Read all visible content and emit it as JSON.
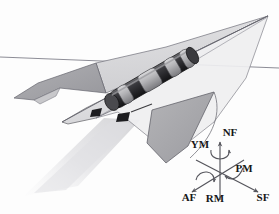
{
  "figure": {
    "background_color": "#fdfdfd",
    "horizon": {
      "name": "horizon-line",
      "color": "#8d8d96",
      "y_left": 57,
      "y_right": 68
    }
  },
  "aircraft": {
    "name": "delta-wing-aircraft",
    "body_color": "#e9e9ea",
    "wing_upper_color": "#d9d9da",
    "wing_shadow_color": "#b6b6b8",
    "fin_color": "#a9a9ac",
    "outline_color": "#6e6e74",
    "nose_point": [
      62,
      122
    ],
    "wing_tip_right": [
      268,
      16
    ],
    "ground_shadow_color": "#e4e4e6"
  },
  "store": {
    "name": "underslung-store-missile",
    "body_color": "#2b2b2e",
    "band_color": "#bcbcbe",
    "highlight_color": "#8a8a8d",
    "pylon_color": "#1d1d20",
    "segments": 4
  },
  "axes": {
    "name": "force-moment-axis-system",
    "origin": [
      220,
      172
    ],
    "line_color": "#55555c",
    "labels": [
      {
        "id": "nf",
        "text": "NF",
        "meaning": "normal-force",
        "kind": "force",
        "x": 230,
        "y": 136
      },
      {
        "id": "ym",
        "text": "YM",
        "meaning": "yaw-moment",
        "kind": "moment",
        "x": 200,
        "y": 148
      },
      {
        "id": "pm",
        "text": "PM",
        "meaning": "pitch-moment",
        "kind": "moment",
        "x": 244,
        "y": 172
      },
      {
        "id": "af",
        "text": "AF",
        "meaning": "axial-force",
        "kind": "force",
        "x": 189,
        "y": 201
      },
      {
        "id": "rm",
        "text": "RM",
        "meaning": "roll-moment",
        "kind": "moment",
        "x": 215,
        "y": 202
      },
      {
        "id": "sf",
        "text": "SF",
        "meaning": "side-force",
        "kind": "force",
        "x": 263,
        "y": 201
      }
    ]
  }
}
